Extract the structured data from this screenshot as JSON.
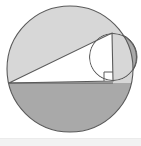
{
  "figure": {
    "name": "circle-triangle-geometry-figure",
    "canvas": {
      "width": 141,
      "height": 146
    },
    "colors": {
      "background": "#ffffff",
      "light_shade": "#d7d7d7",
      "dark_shade": "#a9a9a9",
      "stroke": "#5a5a5a",
      "triangle_fill": "#ffffff",
      "footer_strip": "#f2f2f2"
    },
    "large_circle": {
      "label": "large-circle",
      "cx": 70,
      "cy": 69,
      "r": 63
    },
    "small_circle": {
      "label": "small-circle",
      "cx": 113,
      "cy": 57,
      "r": 24
    },
    "triangle": {
      "label": "right-triangle",
      "vertices": [
        {
          "name": "A",
          "x": 9,
          "y": 83
        },
        {
          "name": "B",
          "x": 112,
          "y": 33
        },
        {
          "name": "C",
          "x": 113,
          "y": 81
        }
      ],
      "points": "9,83 112,33 113,81"
    },
    "chord_line": {
      "label": "horizontal-chord",
      "x1": 9,
      "y1": 83,
      "x2": 113,
      "y2": 83
    },
    "right_angle_marker": {
      "label": "right-angle-marker",
      "points": "104,81 104,72 113,72",
      "vertex": "C",
      "size": 9
    },
    "upper_segment": {
      "label": "upper-shaded-segment",
      "fill": "#d7d7d7"
    },
    "lower_segment": {
      "label": "lower-shaded-half",
      "fill": "#a9a9a9"
    }
  },
  "footer": {
    "label": "bottom-strip"
  }
}
